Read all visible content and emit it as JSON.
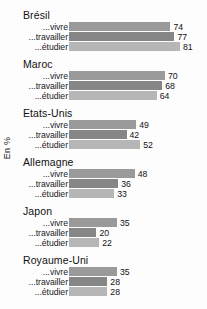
{
  "chart_data": {
    "type": "bar",
    "orientation": "horizontal",
    "title": "",
    "xlabel": "",
    "ylabel": "En %",
    "xlim": [
      0,
      100
    ],
    "grid": false,
    "legend": "none",
    "categories": [
      "Brésil",
      "Maroc",
      "Etats-Unis",
      "Allemagne",
      "Japon",
      "Royaume-Uni"
    ],
    "series": [
      {
        "name": "...vivre",
        "values": [
          74,
          70,
          49,
          48,
          35,
          35
        ]
      },
      {
        "name": "...travailler",
        "values": [
          77,
          68,
          42,
          36,
          20,
          28
        ]
      },
      {
        "name": "...étudier",
        "values": [
          81,
          64,
          52,
          33,
          22,
          28
        ]
      }
    ],
    "groups": [
      {
        "label": "Brésil",
        "bars": [
          {
            "label": "...vivre",
            "value": 74,
            "value_text": "74",
            "color": "#9a9a9a"
          },
          {
            "label": "...travailler",
            "value": 77,
            "value_text": "77",
            "color": "#868686"
          },
          {
            "label": "...étudier",
            "value": 81,
            "value_text": "81",
            "color": "#b6b6b6"
          }
        ]
      },
      {
        "label": "Maroc",
        "bars": [
          {
            "label": "...vivre",
            "value": 70,
            "value_text": "70",
            "color": "#9a9a9a"
          },
          {
            "label": "...travailler",
            "value": 68,
            "value_text": "68",
            "color": "#868686"
          },
          {
            "label": "...étudier",
            "value": 64,
            "value_text": "64",
            "color": "#b6b6b6"
          }
        ]
      },
      {
        "label": "Etats-Unis",
        "bars": [
          {
            "label": "...vivre",
            "value": 49,
            "value_text": "49",
            "color": "#9a9a9a"
          },
          {
            "label": "...travailler",
            "value": 42,
            "value_text": "42",
            "color": "#868686"
          },
          {
            "label": "...étudier",
            "value": 52,
            "value_text": "52",
            "color": "#b6b6b6"
          }
        ]
      },
      {
        "label": "Allemagne",
        "bars": [
          {
            "label": "...vivre",
            "value": 48,
            "value_text": "48",
            "color": "#9a9a9a"
          },
          {
            "label": "...travailler",
            "value": 36,
            "value_text": "36",
            "color": "#868686"
          },
          {
            "label": "...étudier",
            "value": 33,
            "value_text": "33",
            "color": "#b6b6b6"
          }
        ]
      },
      {
        "label": "Japon",
        "bars": [
          {
            "label": "...vivre",
            "value": 35,
            "value_text": "35",
            "color": "#9a9a9a"
          },
          {
            "label": "...travailler",
            "value": 20,
            "value_text": "20",
            "color": "#868686"
          },
          {
            "label": "...étudier",
            "value": 22,
            "value_text": "22",
            "color": "#b6b6b6"
          }
        ]
      },
      {
        "label": "Royaume-Uni",
        "bars": [
          {
            "label": "...vivre",
            "value": 35,
            "value_text": "35",
            "color": "#9a9a9a"
          },
          {
            "label": "...travailler",
            "value": 28,
            "value_text": "28",
            "color": "#868686"
          },
          {
            "label": "...étudier",
            "value": 28,
            "value_text": "28",
            "color": "#b6b6b6"
          }
        ]
      }
    ]
  },
  "layout": {
    "bar_origin_x": 69,
    "px_per_unit": 1.37,
    "group_top_first": 9,
    "group_spacing": 49,
    "row_spacing": 10,
    "bar_height": 9
  }
}
